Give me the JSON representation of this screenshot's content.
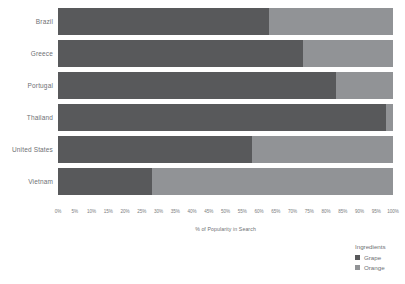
{
  "chart_data": {
    "type": "bar",
    "subtype": "stacked-horizontal-100-percent",
    "title": "",
    "xlabel": "% of Popularity in Search",
    "ylabel": "",
    "xlim": [
      0,
      100
    ],
    "grid": false,
    "legend_position": "bottom-right",
    "categories": [
      "Brazil",
      "Greece",
      "Portugal",
      "Thailand",
      "United States",
      "Vietnam"
    ],
    "series": [
      {
        "name": "Grape",
        "color": "#58595b",
        "values": [
          63,
          73,
          83,
          98,
          58,
          28
        ]
      },
      {
        "name": "Orange",
        "color": "#919396",
        "values": [
          37,
          27,
          17,
          2,
          42,
          72
        ]
      }
    ],
    "xticks": [
      "0%",
      "5%",
      "10%",
      "15%",
      "20%",
      "25%",
      "30%",
      "35%",
      "40%",
      "45%",
      "50%",
      "55%",
      "60%",
      "65%",
      "70%",
      "75%",
      "80%",
      "85%",
      "90%",
      "95%",
      "100%"
    ],
    "xtick_values": [
      0,
      5,
      10,
      15,
      20,
      25,
      30,
      35,
      40,
      45,
      50,
      55,
      60,
      65,
      70,
      75,
      80,
      85,
      90,
      95,
      100
    ]
  },
  "legend": {
    "title": "Ingredients",
    "items": [
      {
        "label": "Grape",
        "color": "#58595b"
      },
      {
        "label": "Orange",
        "color": "#919396"
      }
    ]
  }
}
